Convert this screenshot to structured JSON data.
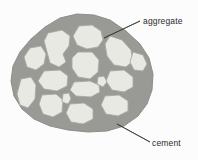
{
  "figure": {
    "type": "diagram",
    "background_color": "#fcfcfc",
    "labels": [
      {
        "id": "aggregate",
        "text": "aggregate",
        "text_x": 143,
        "text_y": 24,
        "leader": {
          "x1": 140,
          "y1": 21,
          "x2": 104,
          "y2": 38
        }
      },
      {
        "id": "cement",
        "text": "cement",
        "text_x": 152,
        "text_y": 146,
        "leader": {
          "x1": 150,
          "y1": 142,
          "x2": 117,
          "y2": 124
        }
      }
    ],
    "colors": {
      "cement_matrix": "#999995",
      "cement_matrix_edge": "#8d8d89",
      "aggregate_fill": "#e9e9e4",
      "aggregate_stroke": "#a9a9a4",
      "leader_line": "#3a3a3a",
      "label_text": "#2b2b2b"
    },
    "matrix_outline": "M 77,14 L 94,15 L 110,20 L 126,31 L 140,44 L 149,58 L 153,74 L 152,90 L 147,104 L 138,116 L 124,126 L 107,131 L 88,132 L 68,130 L 50,126 L 34,119 L 22,109 L 14,96 L 11,81 L 13,66 L 20,52 L 31,39 L 45,27 L 60,18 Z",
    "aggregates": [
      {
        "id": "agg-1",
        "path": "M 79,26 L 92,25 L 101,31 L 103,40 L 98,47 L 87,49 L 77,45 L 73,36 Z"
      },
      {
        "id": "agg-2",
        "path": "M 48,33 L 62,30 L 70,36 L 69,46 L 63,54 L 66,62 L 59,67 L 50,63 L 47,52 L 44,41 Z"
      },
      {
        "id": "agg-3",
        "path": "M 110,36 L 122,40 L 131,50 L 133,61 L 126,67 L 114,65 L 107,56 L 105,44 Z"
      },
      {
        "id": "agg-4",
        "path": "M 30,48 L 41,46 L 46,54 L 44,64 L 36,70 L 27,67 L 24,57 Z"
      },
      {
        "id": "agg-5",
        "path": "M 78,52 L 92,52 L 99,60 L 98,72 L 90,79 L 78,77 L 72,68 L 72,58 Z"
      },
      {
        "id": "agg-6",
        "path": "M 44,71 L 60,70 L 68,76 L 67,86 L 57,91 L 44,89 L 38,81 Z"
      },
      {
        "id": "agg-7",
        "path": "M 110,71 L 124,70 L 133,77 L 133,87 L 124,92 L 112,90 L 106,81 Z"
      },
      {
        "id": "agg-8",
        "path": "M 21,79 L 31,77 L 36,85 L 35,99 L 28,108 L 20,105 L 17,94 Z"
      },
      {
        "id": "agg-9",
        "path": "M 74,82 L 90,81 L 99,85 L 100,92 L 91,97 L 76,96 L 70,90 Z"
      },
      {
        "id": "agg-10",
        "path": "M 42,95 L 56,94 L 63,100 L 62,112 L 53,117 L 43,114 L 39,104 Z"
      },
      {
        "id": "agg-11",
        "path": "M 105,96 L 119,95 L 128,101 L 128,111 L 118,116 L 106,114 L 101,105 Z"
      },
      {
        "id": "agg-12",
        "path": "M 70,104 L 84,103 L 93,109 L 93,119 L 83,124 L 71,122 L 66,113 Z"
      },
      {
        "id": "agg-13",
        "path": "M 133,52 L 143,55 L 147,64 L 143,71 L 134,70 L 130,62 Z"
      },
      {
        "id": "agg-14",
        "path": "M 63,94 L 69,93 L 71,99 L 68,104 L 62,102 Z"
      },
      {
        "id": "agg-15",
        "path": "M 98,77 L 104,76 L 107,82 L 103,87 L 97,84 Z"
      }
    ]
  }
}
